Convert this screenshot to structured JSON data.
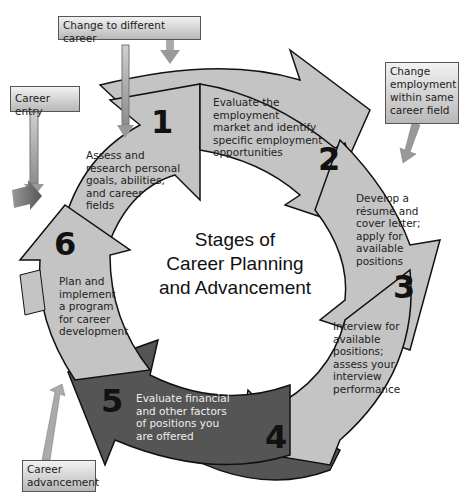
{
  "diagram": {
    "title_lines": [
      "Stages of",
      "Career Planning",
      "and Advancement"
    ],
    "stages": [
      {
        "number": "1",
        "lines": [
          "Assess and",
          "research personal",
          "goals, abilities,",
          "and career",
          "fields"
        ]
      },
      {
        "number": "2",
        "lines": [
          "Evaluate the",
          "employment",
          "market and identify",
          "specific employment",
          "opportunities"
        ]
      },
      {
        "number": "3",
        "lines": [
          "Develop a",
          "résumé and",
          "cover letter;",
          "apply for",
          "available",
          "positions"
        ]
      },
      {
        "number": "4",
        "lines": [
          "Interview for",
          "available",
          "positions;",
          "assess your",
          "interview",
          "performance"
        ]
      },
      {
        "number": "5",
        "lines": [
          "Evaluate financial",
          "and other factors",
          "of positions you",
          "are offered"
        ]
      },
      {
        "number": "6",
        "lines": [
          "Plan and",
          "implement",
          "a program",
          "for career",
          "development"
        ]
      }
    ],
    "entry_points": [
      {
        "lines": [
          "Change to different career"
        ]
      },
      {
        "lines": [
          "Career entry"
        ]
      },
      {
        "lines": [
          "Change",
          "employment",
          "within same",
          "career field"
        ]
      },
      {
        "lines": [
          "Career",
          "advancement"
        ]
      }
    ],
    "colors": {
      "light_arrow": "#c4c4c4",
      "dark_arrow": "#555555",
      "medium_arrow": "#8a8a8a",
      "outline": "#111111"
    }
  }
}
